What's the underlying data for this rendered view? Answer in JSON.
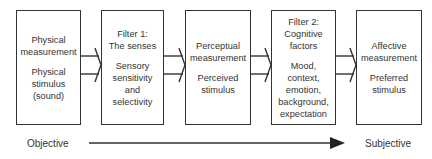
{
  "diagram": {
    "boxes": [
      {
        "title": "Physical\nmeasurement",
        "body": "Physical\nstimulus\n(sound)"
      },
      {
        "title": "Filter 1:\nThe senses",
        "body": "Sensory\nsensitivity\nand\nselectivity"
      },
      {
        "title": "Perceptual\nmeasurement",
        "body": "Perceived\nstimulus"
      },
      {
        "title": "Filter 2:\nCognitive\nfactors",
        "body": "Mood,\ncontext,\nemotion,\nbackground,\nexpectation"
      },
      {
        "title": "Affective\nmeasurement",
        "body": "Preferred\nstimulus"
      }
    ],
    "axis": {
      "left_label": "Objective",
      "right_label": "Subjective"
    },
    "colors": {
      "stroke": "#333333",
      "text": "#333333",
      "background": "#ffffff"
    }
  }
}
